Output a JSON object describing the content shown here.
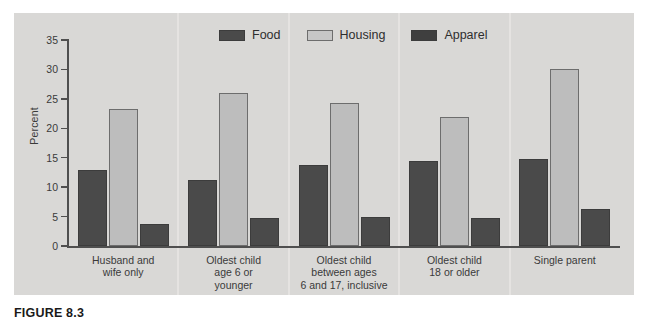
{
  "caption": "FIGURE 8.3",
  "legend": {
    "position": "top-center",
    "items": [
      {
        "label": "Food",
        "color": "#4a4a4a",
        "swatch": "food-swatch"
      },
      {
        "label": "Housing",
        "color": "#c6c6c6",
        "swatch": "housing-swatch"
      },
      {
        "label": "Apparel",
        "color": "#3f3f3f",
        "swatch": "apparel-swatch"
      }
    ]
  },
  "axes": {
    "y_title": "Percent",
    "y_ticks": [
      "0",
      "5",
      "10",
      "15",
      "20",
      "25",
      "30",
      "35"
    ]
  },
  "chart_data": {
    "type": "bar",
    "title": "",
    "subtitle": "",
    "xlabel": "",
    "ylabel": "Percent",
    "ylim": [
      0,
      35
    ],
    "ytick_step": 5,
    "grid": false,
    "legend_position": "top-center",
    "categories": [
      "Husband and\nwife only",
      "Oldest child\nage 6 or\nyounger",
      "Oldest child\nbetween ages\n6 and 17, inclusive",
      "Oldest child\n18 or older",
      "Single parent"
    ],
    "series": [
      {
        "name": "Food",
        "color": "#4a4a4a",
        "values": [
          13.0,
          11.3,
          13.7,
          14.4,
          14.8
        ]
      },
      {
        "name": "Housing",
        "color": "#bdbdbd",
        "values": [
          23.2,
          26.0,
          24.3,
          22.0,
          30.0
        ]
      },
      {
        "name": "Apparel",
        "color": "#4a4a4a",
        "values": [
          3.8,
          4.7,
          5.0,
          4.7,
          6.3
        ]
      }
    ]
  },
  "colors": {
    "panel_background": "#d9d8d6",
    "page_background": "#ffffff",
    "axis": "#4f4f4f",
    "dark_bar": "#4a4a4a",
    "light_bar": "#bdbdbd",
    "separator": "#e6e5e3"
  }
}
